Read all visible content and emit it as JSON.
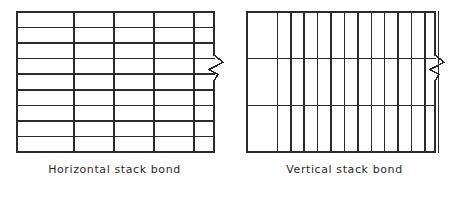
{
  "figure": {
    "background_color": "#ffffff",
    "line_color": "#2b2b2b",
    "text_color": "#2b2b2b"
  },
  "panels": [
    {
      "id": "horizontal-stack-bond",
      "caption": "Horizontal stack bond",
      "diagram": {
        "type": "brick-bond-grid",
        "orientation": "horizontal",
        "description": "Wide horizontal brick units stacked in continuous vertical joints",
        "wall_left": 17,
        "wall_top": 12,
        "wall_right": 214,
        "wall_bottom": 152,
        "course_count": 9,
        "perpend_count": 4,
        "horizontal_joint_y": [
          27.6,
          43.1,
          58.7,
          74.2,
          89.8,
          105.3,
          120.9,
          136.4
        ],
        "vertical_joint_x": [
          57,
          97,
          137,
          177
        ],
        "break_symbol": {
          "present": true,
          "edge": "right",
          "center_y": 68,
          "amplitude": 9,
          "height": 26
        },
        "edge_stroke_width": 1.9,
        "joint_stroke_width": 1.5
      }
    },
    {
      "id": "vertical-stack-bond",
      "caption": "Vertical stack bond",
      "diagram": {
        "type": "brick-bond-grid",
        "orientation": "vertical",
        "description": "Tall vertical brick units stacked in continuous horizontal joints",
        "wall_left": 17,
        "wall_top": 12,
        "wall_right": 205,
        "wall_bottom": 152,
        "course_count": 3,
        "perpend_count": 13,
        "horizontal_joint_y": [
          58.7,
          105.3
        ],
        "vertical_joint_x": [
          30.4,
          43.8,
          57.2,
          70.6,
          84.0,
          97.4,
          110.9,
          124.3,
          137.7,
          151.1,
          164.5,
          177.9,
          191.3
        ],
        "break_symbol": {
          "present": true,
          "edge": "right",
          "center_y": 68,
          "amplitude": 9,
          "height": 26
        },
        "edge_stroke_width": 1.9,
        "joint_stroke_width": 1.5
      }
    }
  ],
  "chart_data": {
    "type": "diagram",
    "items": [
      {
        "label": "Horizontal stack bond",
        "courses": 9,
        "units_per_course": 5,
        "unit_shape": "wide rectangle (stretcher laid horizontally)",
        "joint_alignment": "head joints aligned vertically, bed joints continuous"
      },
      {
        "label": "Vertical stack bond",
        "courses": 3,
        "units_per_course": 14,
        "unit_shape": "tall rectangle (soldier laid vertically)",
        "joint_alignment": "head joints aligned vertically, bed joints continuous"
      }
    ]
  }
}
